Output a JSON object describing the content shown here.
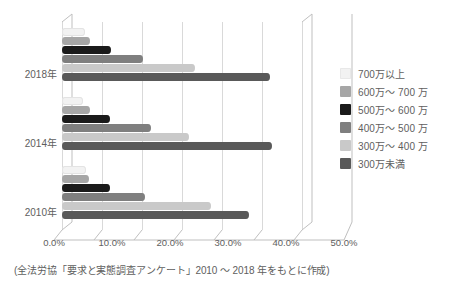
{
  "chart_data": {
    "type": "bar",
    "orientation": "horizontal",
    "title": "",
    "xlabel": "",
    "ylabel": "",
    "categories": [
      "2018年",
      "2014年",
      "2010年"
    ],
    "xlim": [
      0,
      50
    ],
    "xticks": [
      "0.0%",
      "10.0%",
      "20.0%",
      "30.0%",
      "40.0%",
      "50.0%"
    ],
    "xtick_values": [
      0,
      10,
      20,
      30,
      40,
      50
    ],
    "grid": true,
    "legend_position": "right",
    "series": [
      {
        "name": "700万以上",
        "color": "#f2f2f2",
        "values": [
          4.5,
          4.2,
          4.8
        ]
      },
      {
        "name": "600万〜 700 万",
        "color": "#a6a6a6",
        "values": [
          5.5,
          5.6,
          5.4
        ]
      },
      {
        "name": "500万〜 600 万",
        "color": "#1a1a1a",
        "values": [
          9.8,
          9.6,
          9.6
        ]
      },
      {
        "name": "400万〜 500 万",
        "color": "#7f7f7f",
        "values": [
          16.2,
          17.8,
          16.6
        ]
      },
      {
        "name": "300万〜 400 万",
        "color": "#c9c9c9",
        "values": [
          26.5,
          25.3,
          29.8
        ]
      },
      {
        "name": "300万未満",
        "color": "#595959",
        "values": [
          41.5,
          42.0,
          37.4
        ]
      }
    ]
  },
  "axis": {
    "year_labels": [
      "2018年",
      "2014年",
      "2010年"
    ],
    "tick_labels": [
      "0.0%",
      "10.0%",
      "20.0%",
      "30.0%",
      "40.0%",
      "50.0%"
    ]
  },
  "legend": {
    "items": [
      {
        "label": "700万以上",
        "color": "#f2f2f2"
      },
      {
        "label": "600万〜 700 万",
        "color": "#a6a6a6"
      },
      {
        "label": "500万〜 600 万",
        "color": "#1a1a1a"
      },
      {
        "label": "400万〜 500 万",
        "color": "#7f7f7f"
      },
      {
        "label": "300万〜 400 万",
        "color": "#c9c9c9"
      },
      {
        "label": "300万未満",
        "color": "#595959"
      }
    ]
  },
  "caption": {
    "text": "(全法労協「要求と実態調査アンケート」2010 〜 2018 年をもとに作成)"
  },
  "colors": {
    "grid": "#d9d9d9",
    "frame": "#bfbfbf",
    "text": "#5e5e5e",
    "background": "#ffffff"
  }
}
